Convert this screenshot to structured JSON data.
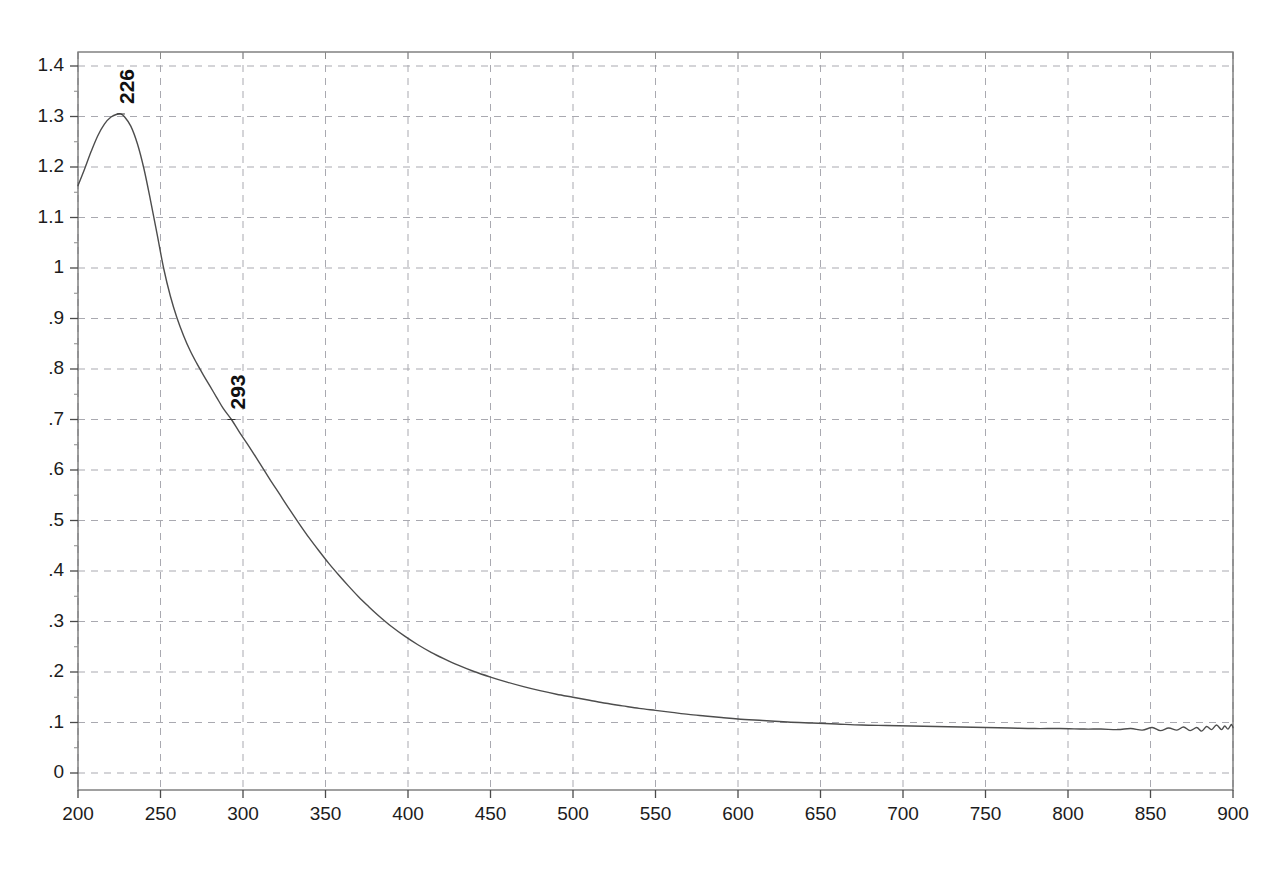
{
  "chart_data": {
    "type": "line",
    "title": "",
    "xlabel": "",
    "ylabel": "",
    "xlim": [
      200,
      900
    ],
    "ylim": [
      0,
      1.45
    ],
    "grid": true,
    "legend": false,
    "x_ticks": [
      200,
      250,
      300,
      350,
      400,
      450,
      500,
      550,
      600,
      650,
      700,
      750,
      800,
      850,
      900
    ],
    "x_tick_labels": [
      "200",
      "250",
      "300",
      "350",
      "400",
      "450",
      "500",
      "550",
      "600",
      "650",
      "700",
      "750",
      "800",
      "850",
      "900"
    ],
    "y_ticks": [
      0,
      0.1,
      0.2,
      0.3,
      0.4,
      0.5,
      0.6,
      0.7,
      0.8,
      0.9,
      1.0,
      1.1,
      1.2,
      1.3,
      1.4
    ],
    "y_tick_labels": [
      "0",
      ".1",
      ".2",
      ".3",
      ".4",
      ".5",
      ".6",
      ".7",
      ".8",
      ".9",
      "1",
      "1.1",
      "1.2",
      "1.3",
      "1.4"
    ],
    "annotations": [
      {
        "label": "226",
        "x": 226,
        "y": 1.305,
        "rotation": -90
      },
      {
        "label": "293",
        "x": 293,
        "y": 0.7,
        "rotation": -90
      }
    ],
    "series": [
      {
        "name": "absorbance",
        "color": "#4d4d4d",
        "x": [
          200,
          204,
          208,
          212,
          216,
          220,
          224,
          226,
          228,
          232,
          236,
          240,
          244,
          248,
          252,
          256,
          260,
          264,
          268,
          272,
          276,
          280,
          284,
          288,
          293,
          298,
          304,
          310,
          316,
          322,
          328,
          334,
          340,
          346,
          352,
          358,
          364,
          370,
          376,
          382,
          390,
          398,
          406,
          414,
          422,
          430,
          440,
          450,
          460,
          470,
          480,
          490,
          500,
          510,
          520,
          530,
          540,
          550,
          560,
          570,
          580,
          590,
          600,
          615,
          630,
          645,
          660,
          675,
          690,
          705,
          720,
          735,
          750,
          765,
          780,
          795,
          810,
          820,
          830,
          838,
          845,
          851,
          856,
          861,
          866,
          870,
          874,
          878,
          881,
          884,
          887,
          890,
          893,
          895,
          897,
          899,
          900
        ],
        "y": [
          1.163,
          1.196,
          1.231,
          1.262,
          1.285,
          1.299,
          1.305,
          1.305,
          1.3,
          1.281,
          1.246,
          1.196,
          1.133,
          1.066,
          0.998,
          0.944,
          0.901,
          0.866,
          0.836,
          0.811,
          0.788,
          0.766,
          0.744,
          0.722,
          0.7,
          0.674,
          0.645,
          0.614,
          0.583,
          0.553,
          0.523,
          0.494,
          0.466,
          0.44,
          0.415,
          0.392,
          0.37,
          0.349,
          0.33,
          0.312,
          0.29,
          0.271,
          0.254,
          0.239,
          0.226,
          0.214,
          0.201,
          0.19,
          0.18,
          0.171,
          0.163,
          0.156,
          0.15,
          0.144,
          0.138,
          0.133,
          0.128,
          0.124,
          0.12,
          0.116,
          0.113,
          0.11,
          0.107,
          0.104,
          0.101,
          0.099,
          0.097,
          0.095,
          0.094,
          0.093,
          0.092,
          0.091,
          0.09,
          0.089,
          0.088,
          0.088,
          0.087,
          0.087,
          0.086,
          0.088,
          0.085,
          0.09,
          0.084,
          0.089,
          0.085,
          0.091,
          0.084,
          0.09,
          0.083,
          0.092,
          0.086,
          0.095,
          0.086,
          0.093,
          0.087,
          0.096,
          0.09
        ]
      }
    ]
  },
  "axes": {
    "plot_left_px": 78,
    "plot_right_px": 1233,
    "plot_top_px": 52,
    "plot_bottom_px": 790
  }
}
